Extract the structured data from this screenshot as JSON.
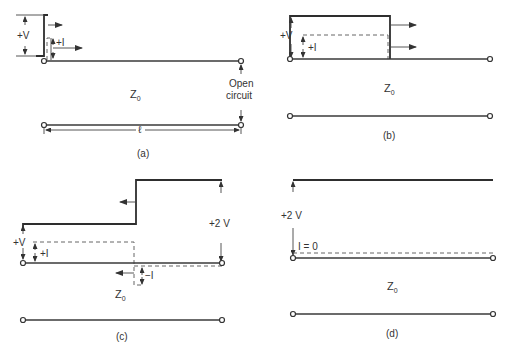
{
  "figure": {
    "panels": [
      {
        "id": "a",
        "caption": "(a)",
        "line_label": "Z",
        "line_label_sub": "0",
        "voltage_label": "+V",
        "current_label": "+I",
        "termination_label_line1": "Open",
        "termination_label_line2": "circuit",
        "length_label": "ℓ"
      },
      {
        "id": "b",
        "caption": "(b)",
        "line_label": "Z",
        "line_label_sub": "0",
        "voltage_label": "+V",
        "current_label": "+I"
      },
      {
        "id": "c",
        "caption": "(c)",
        "line_label": "Z",
        "line_label_sub": "0",
        "voltage_label": "+V",
        "current_label": "+I",
        "reflected_voltage_label": "+2 V",
        "reflected_current_label": "−I"
      },
      {
        "id": "d",
        "caption": "(d)",
        "line_label": "Z",
        "line_label_sub": "0",
        "voltage_label": "+2 V",
        "current_label": "I = 0"
      }
    ]
  },
  "colors": {
    "line": "#333333",
    "dashed": "#666666",
    "background": "#ffffff"
  }
}
